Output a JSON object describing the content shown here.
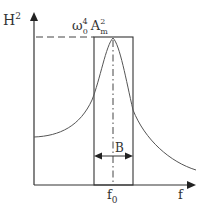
{
  "diagram": {
    "y_axis": {
      "label": "H",
      "label_sup": "2"
    },
    "x_axis": {
      "label": "f"
    },
    "peak_label": {
      "omega": "ω",
      "omega_sub": "0",
      "omega_sup": "4",
      "A": "A",
      "A_sub": "m",
      "A_sup": "2"
    },
    "center_label": {
      "main": "f",
      "sub": "0"
    },
    "bandwidth_label": "B",
    "colors": {
      "line": "#333333",
      "curve": "#555555"
    }
  }
}
